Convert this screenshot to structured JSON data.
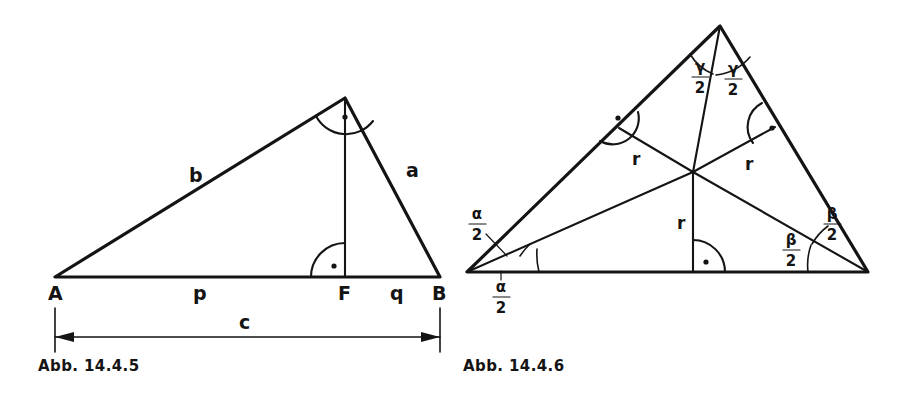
{
  "page": {
    "background": "#ffffff",
    "ink": "#141414",
    "width": 907,
    "height": 395
  },
  "figures": [
    {
      "id": "fig-14-4-5",
      "caption": "Abb. 14.4.5",
      "description": "Right triangle with altitude to hypotenuse",
      "vertices": {
        "A": {
          "label": "A",
          "x": 55,
          "y": 277
        },
        "B": {
          "label": "B",
          "x": 440,
          "y": 277
        },
        "C": {
          "label": "C",
          "x": 345,
          "y": 98
        },
        "F": {
          "label": "F",
          "x": 345,
          "y": 277
        }
      },
      "side_labels": [
        {
          "name": "side-b",
          "text": "b",
          "x": 193,
          "y": 182
        },
        {
          "name": "side-a",
          "text": "a",
          "x": 410,
          "y": 177
        },
        {
          "name": "segment-p",
          "text": "p",
          "x": 197,
          "y": 298
        },
        {
          "name": "segment-q",
          "text": "q",
          "x": 394,
          "y": 298
        }
      ],
      "vertex_labels": [
        {
          "name": "vertex-A",
          "text": "A",
          "x": 48,
          "y": 300
        },
        {
          "name": "vertex-F",
          "text": "F",
          "x": 338,
          "y": 300
        },
        {
          "name": "vertex-B",
          "text": "B",
          "x": 434,
          "y": 300
        }
      ],
      "dimension": {
        "name": "hypotenuse-dimension",
        "label": "c",
        "label_x": 243,
        "label_y": 326,
        "from_x": 55,
        "to_x": 440,
        "y": 337
      },
      "right_angles": [
        {
          "name": "right-angle-at-C",
          "at": "C",
          "x": 345,
          "y": 98
        },
        {
          "name": "right-angle-at-F",
          "at": "F",
          "x": 345,
          "y": 277
        }
      ]
    },
    {
      "id": "fig-14-4-6",
      "caption": "Abb. 14.4.6",
      "description": "Triangle with incircle center, angle bisectors and inradius r",
      "vertices": {
        "A": {
          "x": 467,
          "y": 272
        },
        "B": {
          "x": 868,
          "y": 272
        },
        "C": {
          "x": 720,
          "y": 26
        },
        "incenter": {
          "x": 693,
          "y": 172
        }
      },
      "radius_labels": [
        {
          "name": "inradius-left",
          "text": "r",
          "x": 636,
          "y": 158
        },
        {
          "name": "inradius-right",
          "text": "r",
          "x": 749,
          "y": 163
        },
        {
          "name": "inradius-bottom",
          "text": "r",
          "x": 681,
          "y": 222
        }
      ],
      "angle_labels": [
        {
          "name": "alpha-half-upper",
          "numerator": "α",
          "denominator": "2",
          "x": 477,
          "y": 222
        },
        {
          "name": "alpha-half-lower",
          "numerator": "α",
          "denominator": "2",
          "x": 500,
          "y": 295
        },
        {
          "name": "beta-half-upper",
          "numerator": "β",
          "denominator": "2",
          "x": 832,
          "y": 222
        },
        {
          "name": "beta-half-lower",
          "numerator": "β",
          "denominator": "2",
          "x": 791,
          "y": 248
        },
        {
          "name": "gamma-half-left",
          "numerator": "γ",
          "denominator": "2",
          "x": 700,
          "y": 70
        },
        {
          "name": "gamma-half-right",
          "numerator": "γ",
          "denominator": "2",
          "x": 733,
          "y": 72
        }
      ],
      "right_angles": [
        {
          "name": "right-angle-side-b",
          "x": 625,
          "y": 131
        },
        {
          "name": "right-angle-side-a",
          "x": 766,
          "y": 130
        },
        {
          "name": "right-angle-side-c",
          "x": 693,
          "y": 272
        }
      ]
    }
  ]
}
